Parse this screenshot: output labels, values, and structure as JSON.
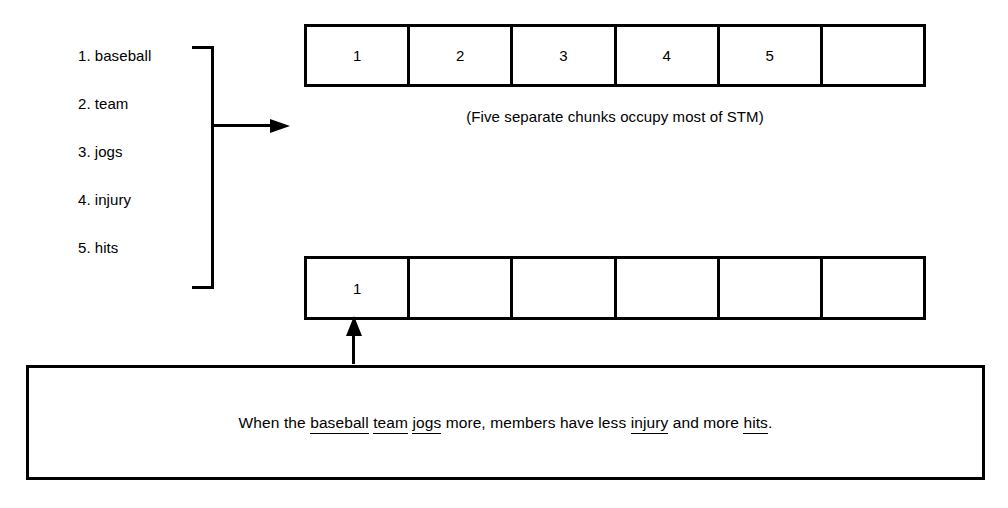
{
  "diagram": {
    "word_list": [
      {
        "num": "1.",
        "word": "baseball"
      },
      {
        "num": "2.",
        "word": "team"
      },
      {
        "num": "3.",
        "word": "jogs"
      },
      {
        "num": "4.",
        "word": "injury"
      },
      {
        "num": "5.",
        "word": "hits"
      }
    ],
    "stm_row_top": {
      "label": "top-stm-row",
      "cells": [
        "1",
        "2",
        "3",
        "4",
        "5",
        ""
      ]
    },
    "caption": "(Five separate chunks occupy most of STM)",
    "stm_row_bottom": {
      "label": "bottom-stm-row",
      "cells": [
        "1",
        "",
        "",
        "",
        "",
        ""
      ]
    },
    "sentence": {
      "parts": [
        {
          "text": "When the ",
          "underlined": false
        },
        {
          "text": "baseball",
          "underlined": true
        },
        {
          "text": " ",
          "underlined": false
        },
        {
          "text": "team",
          "underlined": true
        },
        {
          "text": " ",
          "underlined": false
        },
        {
          "text": "jogs",
          "underlined": true
        },
        {
          "text": " more, members have less ",
          "underlined": false
        },
        {
          "text": "injury",
          "underlined": true
        },
        {
          "text": " and more ",
          "underlined": false
        },
        {
          "text": "hits",
          "underlined": true
        },
        {
          "text": ".",
          "underlined": false
        }
      ]
    },
    "colors": {
      "ink": "#000000",
      "background": "#ffffff"
    }
  }
}
